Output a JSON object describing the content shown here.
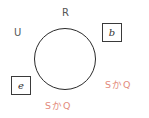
{
  "diagram": {
    "type": "set-diagram",
    "universe_label": "U",
    "set_label": "R",
    "circle": {
      "cx": 65,
      "cy": 59,
      "r": 31
    },
    "boxes": [
      {
        "id": "b",
        "value": "b",
        "position": "outside-top-right"
      },
      {
        "id": "e",
        "value": "e",
        "position": "outside-bottom-left"
      }
    ],
    "annotations": [
      {
        "id": "right",
        "text": "SかQ",
        "color": "#e38b7c"
      },
      {
        "id": "bottom",
        "text": "SかQ",
        "color": "#e38b7c"
      }
    ]
  }
}
